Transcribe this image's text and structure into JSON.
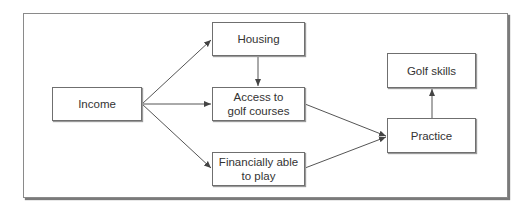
{
  "diagram": {
    "nodes": [
      {
        "id": "income",
        "label": "Income"
      },
      {
        "id": "housing",
        "label": "Housing"
      },
      {
        "id": "access",
        "label": "Access to\ngolf courses"
      },
      {
        "id": "financially",
        "label": "Financially able\nto play"
      },
      {
        "id": "practice",
        "label": "Practice"
      },
      {
        "id": "golf_skills",
        "label": "Golf skills"
      }
    ],
    "edges": [
      {
        "from": "income",
        "to": "housing"
      },
      {
        "from": "income",
        "to": "access"
      },
      {
        "from": "income",
        "to": "financially"
      },
      {
        "from": "housing",
        "to": "access"
      },
      {
        "from": "access",
        "to": "practice"
      },
      {
        "from": "financially",
        "to": "practice"
      },
      {
        "from": "practice",
        "to": "golf_skills"
      }
    ]
  }
}
